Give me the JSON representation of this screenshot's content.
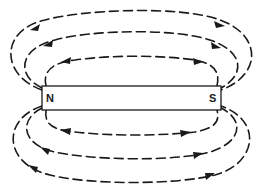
{
  "figure": {
    "magnet": {
      "north_label": "N",
      "south_label": "S",
      "box": {
        "x": 42,
        "y": 86,
        "width": 179,
        "height": 24
      }
    },
    "field_lines": {
      "count": 6,
      "style": "dashed",
      "top_loops": 3,
      "bottom_loops": 3,
      "color": "#1a1a1a"
    },
    "background": "#ffffff"
  }
}
